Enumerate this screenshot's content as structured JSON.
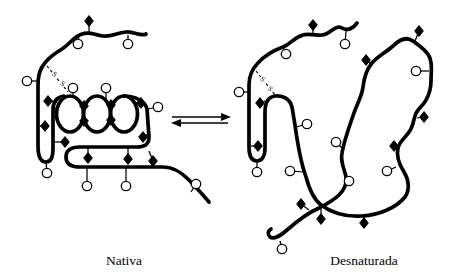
{
  "labels": {
    "native": "Nativa",
    "denatured": "Desnaturada"
  },
  "disulfide": {
    "letter": "S"
  },
  "colors": {
    "ink": "#000000",
    "paper": "#ffffff"
  },
  "icons": {
    "diamond": "nonpolar-group-icon",
    "circle": "polar-group-icon"
  },
  "markers": {
    "native": {
      "diamonds": [
        {
          "x": 89,
          "y": 21,
          "sx": 89,
          "sy": 33
        },
        {
          "x": 48,
          "y": 101,
          "sx": 53,
          "sy": 101
        },
        {
          "x": 45,
          "y": 126,
          "sx": 39,
          "sy": 126
        },
        {
          "x": 65,
          "y": 142,
          "sx": 54,
          "sy": 142
        },
        {
          "x": 84,
          "y": 106,
          "sx": 84,
          "sy": 112
        },
        {
          "x": 84,
          "y": 121,
          "sx": 84,
          "sy": 115
        },
        {
          "x": 111,
          "y": 105,
          "sx": 111,
          "sy": 112
        },
        {
          "x": 111,
          "y": 120,
          "sx": 111,
          "sy": 114
        },
        {
          "x": 141,
          "y": 103,
          "sx": 135,
          "sy": 103
        },
        {
          "x": 143,
          "y": 137,
          "sx": 148,
          "sy": 134
        },
        {
          "x": 88,
          "y": 158,
          "sx": 88,
          "sy": 148
        },
        {
          "x": 128,
          "y": 159,
          "sx": 128,
          "sy": 148
        },
        {
          "x": 153,
          "y": 161,
          "sx": 149,
          "sy": 151
        }
      ],
      "circles": [
        {
          "x": 78,
          "y": 44,
          "sx": 79,
          "sy": 34
        },
        {
          "x": 128,
          "y": 44,
          "sx": 128,
          "sy": 35
        },
        {
          "x": 27,
          "y": 81,
          "sx": 37,
          "sy": 81
        },
        {
          "x": 73,
          "y": 88,
          "sx": 73,
          "sy": 96
        },
        {
          "x": 106,
          "y": 88,
          "sx": 106,
          "sy": 99
        },
        {
          "x": 158,
          "y": 107,
          "sx": 148,
          "sy": 109
        },
        {
          "x": 47,
          "y": 173,
          "sx": 46,
          "sy": 162
        },
        {
          "x": 87,
          "y": 186,
          "sx": 87,
          "sy": 168
        },
        {
          "x": 126,
          "y": 186,
          "sx": 126,
          "sy": 168
        },
        {
          "x": 196,
          "y": 184,
          "sx": 191,
          "sy": 192
        }
      ]
    },
    "denatured": {
      "diamonds": [
        {
          "x": 313,
          "y": 25,
          "sx": 313,
          "sy": 35
        },
        {
          "x": 419,
          "y": 31,
          "sx": 415,
          "sy": 41
        },
        {
          "x": 366,
          "y": 60,
          "sx": 371,
          "sy": 64
        },
        {
          "x": 424,
          "y": 117,
          "sx": 417,
          "sy": 118
        },
        {
          "x": 394,
          "y": 146,
          "sx": 398,
          "sy": 147
        },
        {
          "x": 260,
          "y": 103,
          "sx": 265,
          "sy": 101
        },
        {
          "x": 258,
          "y": 146,
          "sx": 251,
          "sy": 146
        },
        {
          "x": 301,
          "y": 204,
          "sx": 309,
          "sy": 210
        },
        {
          "x": 321,
          "y": 219,
          "sx": 321,
          "sy": 209
        },
        {
          "x": 364,
          "y": 223,
          "sx": 364,
          "sy": 216
        }
      ],
      "circles": [
        {
          "x": 345,
          "y": 44,
          "sx": 346,
          "sy": 31
        },
        {
          "x": 286,
          "y": 54,
          "sx": 283,
          "sy": 47
        },
        {
          "x": 239,
          "y": 92,
          "sx": 248,
          "sy": 92
        },
        {
          "x": 307,
          "y": 124,
          "sx": 296,
          "sy": 127
        },
        {
          "x": 290,
          "y": 171,
          "sx": 304,
          "sy": 172
        },
        {
          "x": 257,
          "y": 172,
          "sx": 257,
          "sy": 162
        },
        {
          "x": 336,
          "y": 142,
          "sx": 344,
          "sy": 150
        },
        {
          "x": 349,
          "y": 181,
          "sx": 345,
          "sy": 175
        },
        {
          "x": 387,
          "y": 171,
          "sx": 396,
          "sy": 167
        },
        {
          "x": 416,
          "y": 71,
          "sx": 429,
          "sy": 71
        },
        {
          "x": 282,
          "y": 249,
          "sx": 280,
          "sy": 241
        }
      ]
    }
  }
}
